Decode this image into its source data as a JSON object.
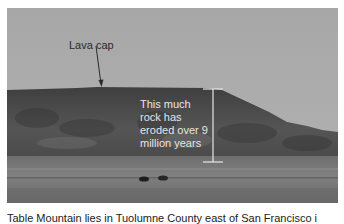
{
  "figure": {
    "photo_description": "Grayscale photograph of a flat-topped mesa (Table Mountain) with a field and two cattle in the foreground",
    "annotations": {
      "lava_cap_label": "Lava cap",
      "erosion_text_lines": [
        "This much",
        "rock has",
        "eroded over 9",
        "million years"
      ]
    },
    "caption": "Table Mountain lies in Tuolumne County east of San Francisco i"
  },
  "colors": {
    "sky": "#acacac",
    "mesa": "#4a4a4a",
    "field": "#6a6a6a",
    "annotation_light": "#e6e6e6",
    "annotation_dark": "#2a2a2a"
  }
}
